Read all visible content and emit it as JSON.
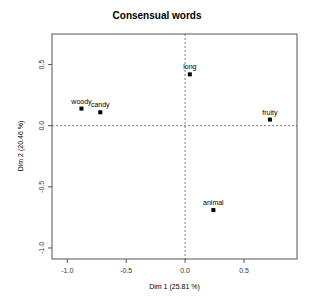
{
  "chart_data": {
    "type": "scatter",
    "title": "Consensual words",
    "xlabel": "Dim 1 (25.81 %)",
    "ylabel": "Dim 2 (20.46 %)",
    "xlim": [
      -1.13,
      0.95
    ],
    "ylim": [
      -1.09,
      0.75
    ],
    "xticks": [
      -1.0,
      -0.5,
      0.0,
      0.5
    ],
    "xtick_labels": [
      "-1.0",
      "-0.5",
      "0.0",
      "0.5"
    ],
    "yticks": [
      -1.0,
      -0.5,
      0.0,
      0.5
    ],
    "ytick_labels": [
      "-1.0",
      "-0.5",
      "0.0",
      "0.5"
    ],
    "grid": false,
    "reference_lines": {
      "x": 0.0,
      "y": 0.0,
      "style": "dotted"
    },
    "points": [
      {
        "label": "woody",
        "x": -0.88,
        "y": 0.14
      },
      {
        "label": "candy",
        "x": -0.72,
        "y": 0.11
      },
      {
        "label": "long",
        "x": 0.04,
        "y": 0.42
      },
      {
        "label": "fruity",
        "x": 0.72,
        "y": 0.05
      },
      {
        "label": "animal",
        "x": 0.24,
        "y": -0.69
      }
    ]
  },
  "colors": {
    "axis": "#555555",
    "points": "#000000",
    "text": "#000000"
  }
}
